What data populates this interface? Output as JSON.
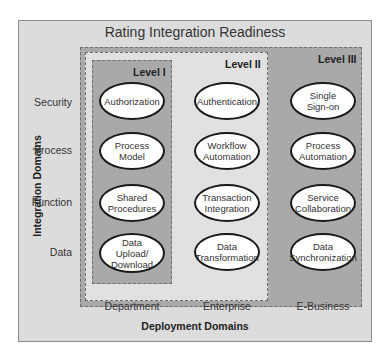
{
  "title": "Rating Integration Readiness",
  "levels": [
    "Level I",
    "Level II",
    "Level III"
  ],
  "integration_domains_label": "Integration Domains",
  "deployment_domains_label": "Deployment Domains",
  "rows": [
    "Security",
    "Process",
    "Function",
    "Data"
  ],
  "columns": [
    "Department",
    "Enterprise",
    "E-Business"
  ],
  "cells": {
    "department": [
      "Authorization",
      "Process\nModel",
      "Shared\nProcedures",
      "Data\nUpload/\nDownload"
    ],
    "enterprise": [
      "Authentication",
      "Workflow\nAutomation",
      "Transaction\nIntegration",
      "Data\nTransformation"
    ],
    "ebusiness": [
      "Single\nSign-on",
      "Process\nAutomation",
      "Service\nCollaboration",
      "Data\nSynchronization"
    ]
  },
  "colors": {
    "frame_bg": "#dcdcdc",
    "dark_level_bg": "#a9a9a9",
    "light_level_bg": "#e1e1e1",
    "ellipse_fill": "#ffffff",
    "ellipse_stroke": "#1a1a1a"
  }
}
